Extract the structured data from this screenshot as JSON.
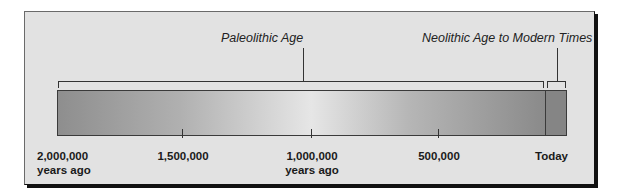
{
  "periods": [
    {
      "label": "Paleolithic Age",
      "from": "2,000,000 years ago",
      "to": "~10,000 years ago"
    },
    {
      "label": "Neolithic Age to Modern Times",
      "from": "~10,000 years ago",
      "to": "Today"
    }
  ],
  "axis": {
    "ticks": [
      {
        "value": 2000000,
        "line1": "2,000,000",
        "line2": "years ago"
      },
      {
        "value": 1500000,
        "line1": "1,500,000",
        "line2": ""
      },
      {
        "value": 1000000,
        "line1": "1,000,000",
        "line2": "years ago"
      },
      {
        "value": 500000,
        "line1": "500,000",
        "line2": ""
      },
      {
        "value": 0,
        "line1": "Today",
        "line2": ""
      }
    ]
  },
  "colors": {
    "panel": "#e2e2e2",
    "bar_dark": "#8e8e8e",
    "bar_light": "#e6e6e6",
    "modern_segment": "#858585",
    "line": "#333333"
  }
}
